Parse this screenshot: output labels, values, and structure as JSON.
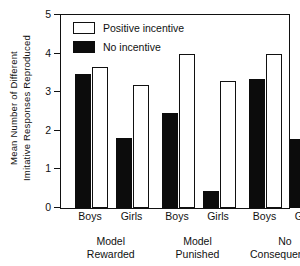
{
  "chart_data": {
    "type": "bar",
    "title": "",
    "xlabel": "",
    "ylabel_line1": "Mean Number of Different",
    "ylabel_line2": "Imitative Responses Reproduced",
    "ylim": [
      0,
      5
    ],
    "ytick_labels": [
      "0",
      "1",
      "2",
      "3",
      "4",
      "5"
    ],
    "ytick_values": [
      0,
      1,
      2,
      3,
      4,
      5
    ],
    "grid": false,
    "legend_position": "top-left",
    "legend": [
      {
        "name": "Positive incentive",
        "style": "open"
      },
      {
        "name": "No incentive",
        "style": "filled"
      }
    ],
    "categories": [
      "Boys",
      "Girls",
      "Boys",
      "Girls",
      "Boys",
      "Girls"
    ],
    "groups": [
      {
        "label_line1": "Model",
        "label_line2": "Rewarded"
      },
      {
        "label_line1": "Model",
        "label_line2": "Punished"
      },
      {
        "label_line1": "No",
        "label_line2": "Consequences"
      }
    ],
    "series": [
      {
        "name": "No incentive",
        "style": "filled",
        "values": [
          3.47,
          1.81,
          2.45,
          0.45,
          3.35,
          1.8
        ]
      },
      {
        "name": "Positive incentive",
        "style": "open",
        "values": [
          3.66,
          3.19,
          4.0,
          3.3,
          4.0,
          2.95
        ]
      }
    ],
    "bars": [
      {
        "group": "Model Rewarded",
        "sex": "Boys",
        "condition": "No incentive",
        "value": 3.47
      },
      {
        "group": "Model Rewarded",
        "sex": "Boys",
        "condition": "Positive incentive",
        "value": 3.66
      },
      {
        "group": "Model Rewarded",
        "sex": "Girls",
        "condition": "No incentive",
        "value": 1.81
      },
      {
        "group": "Model Rewarded",
        "sex": "Girls",
        "condition": "Positive incentive",
        "value": 3.19
      },
      {
        "group": "Model Punished",
        "sex": "Boys",
        "condition": "No incentive",
        "value": 2.45
      },
      {
        "group": "Model Punished",
        "sex": "Boys",
        "condition": "Positive incentive",
        "value": 4.0
      },
      {
        "group": "Model Punished",
        "sex": "Girls",
        "condition": "No incentive",
        "value": 0.45
      },
      {
        "group": "Model Punished",
        "sex": "Girls",
        "condition": "Positive incentive",
        "value": 3.3
      },
      {
        "group": "No Consequences",
        "sex": "Boys",
        "condition": "No incentive",
        "value": 3.35
      },
      {
        "group": "No Consequences",
        "sex": "Boys",
        "condition": "Positive incentive",
        "value": 4.0
      },
      {
        "group": "No Consequences",
        "sex": "Girls",
        "condition": "No incentive",
        "value": 1.8
      },
      {
        "group": "No Consequences",
        "sex": "Girls",
        "condition": "Positive incentive",
        "value": 2.95
      }
    ],
    "colors": {
      "filled": "#0c0c0c",
      "open": "#ffffff",
      "axis": "#111111",
      "background": "#ffffff"
    }
  }
}
